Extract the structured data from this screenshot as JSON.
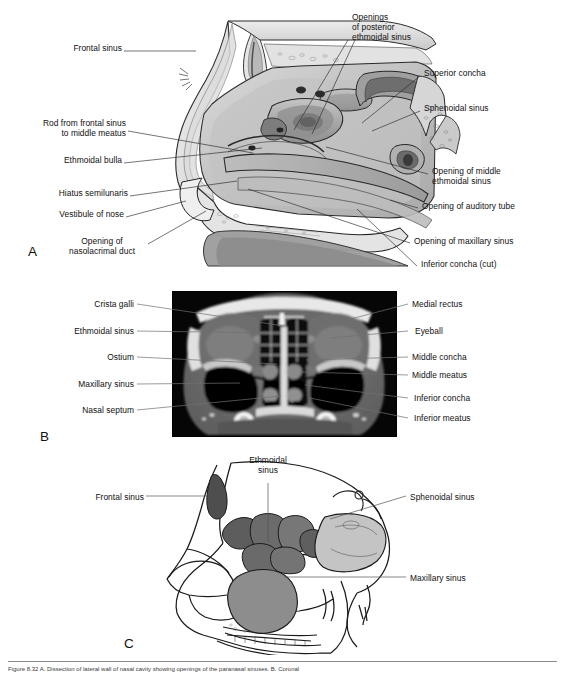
{
  "figure": {
    "width": 565,
    "height": 676,
    "panel_letters": [
      "A",
      "B",
      "C"
    ],
    "caption": "Figure 8.32   A. Dissection of lateral wall of nasal cavity showing openings of the paranasal sinuses. B. Coronal"
  },
  "panel_a": {
    "letter": "A",
    "type": "line-art-dissection",
    "description": "Sagittal dissection of the lateral wall of the nasal cavity",
    "labels_left": [
      {
        "text": "Frontal sinus",
        "x": 118,
        "y": 47,
        "lx": 124,
        "ly": 51,
        "tx": 196,
        "ty": 51
      },
      {
        "text": "Rod from frontal sinus\nto middle meatus",
        "x": 124,
        "y": 122,
        "lx": 128,
        "ly": 131,
        "tx": 253,
        "ty": 153
      },
      {
        "text": "Ethmoidal bulla",
        "x": 117,
        "y": 159,
        "lx": 124,
        "ly": 163,
        "tx": 262,
        "ty": 148
      },
      {
        "text": "Hiatus semilunaris",
        "x": 126,
        "y": 192,
        "lx": 130,
        "ly": 196,
        "tx": 235,
        "ty": 180
      },
      {
        "text": "Vestibule of nose",
        "x": 121,
        "y": 213,
        "lx": 126,
        "ly": 217,
        "tx": 183,
        "ty": 200
      },
      {
        "text": "Opening of\nnasolacrimal duct",
        "x": 120,
        "y": 240,
        "lx": 148,
        "ly": 244,
        "tx": 205,
        "ty": 210
      }
    ],
    "labels_right": [
      {
        "text": "Openings\nof posterior\nethmoidal sinus",
        "x": 352,
        "y": 16,
        "lx": 348,
        "ly": 40,
        "tx": 293,
        "ty": 132
      },
      {
        "text": "Openings\nof posterior\nethmoidal sinus 2",
        "x": -1,
        "y": -1,
        "lx": 350,
        "ly": 42,
        "tx": 310,
        "ty": 135
      },
      {
        "text": "Superior concha",
        "x": 424,
        "y": 72,
        "lx": 420,
        "ly": 76,
        "tx": 360,
        "ty": 125
      },
      {
        "text": "Sphenoidal sinus",
        "x": 424,
        "y": 107,
        "lx": 420,
        "ly": 111,
        "tx": 370,
        "ty": 132
      },
      {
        "text": "Opening of middle\nethmoidal sinus",
        "x": 432,
        "y": 170,
        "lx": 428,
        "ly": 174,
        "tx": 325,
        "ty": 148
      },
      {
        "text": "Opening of auditory tube",
        "x": 422,
        "y": 205,
        "lx": 418,
        "ly": 208,
        "tx": 387,
        "ty": 200
      },
      {
        "text": "Opening of maxillary sinus",
        "x": 414,
        "y": 240,
        "lx": 410,
        "ly": 243,
        "tx": 248,
        "ty": 190
      },
      {
        "text": "Inferior concha (cut)",
        "x": 421,
        "y": 263,
        "lx": 417,
        "ly": 266,
        "tx": 355,
        "ty": 210
      }
    ]
  },
  "panel_b": {
    "letter": "B",
    "type": "ct-scan",
    "description": "Coronal CT scan of the paranasal sinuses",
    "image_rect": {
      "x": 172,
      "y": 291,
      "w": 225,
      "h": 146
    },
    "labels_left": [
      {
        "text": "Crista galli",
        "x": 88,
        "y": 300,
        "lx": 137,
        "ly": 304,
        "tx": 284,
        "ty": 326
      },
      {
        "text": "Ethmoidal sinus",
        "x": 68,
        "y": 327,
        "lx": 137,
        "ly": 331,
        "tx": 272,
        "ty": 333
      },
      {
        "text": "Ostium",
        "x": 107,
        "y": 353,
        "lx": 137,
        "ly": 357,
        "tx": 277,
        "ty": 364
      },
      {
        "text": "Maxillary sinus",
        "x": 73,
        "y": 380,
        "lx": 137,
        "ly": 384,
        "tx": 240,
        "ty": 383
      },
      {
        "text": "Nasal septum",
        "x": 78,
        "y": 406,
        "lx": 137,
        "ly": 410,
        "tx": 281,
        "ty": 395
      }
    ],
    "labels_right": [
      {
        "text": "Medial rectus",
        "x": 412,
        "y": 300,
        "lx": 408,
        "ly": 304,
        "tx": 320,
        "ty": 327
      },
      {
        "text": "Eyeball",
        "x": 415,
        "y": 327,
        "lx": 408,
        "ly": 331,
        "tx": 330,
        "ty": 338
      },
      {
        "text": "Middle concha",
        "x": 412,
        "y": 353,
        "lx": 408,
        "ly": 357,
        "tx": 306,
        "ty": 360
      },
      {
        "text": "Middle meatus",
        "x": 412,
        "y": 371,
        "lx": 408,
        "ly": 375,
        "tx": 302,
        "ty": 372
      },
      {
        "text": "Inferior concha",
        "x": 412,
        "y": 395,
        "lx": 408,
        "ly": 398,
        "tx": 305,
        "ty": 385
      },
      {
        "text": "Inferior meatus",
        "x": 412,
        "y": 415,
        "lx": 408,
        "ly": 418,
        "tx": 310,
        "ty": 398
      }
    ]
  },
  "panel_c": {
    "letter": "C",
    "type": "line-art-skull",
    "description": "Lateral view of skull showing the paranasal sinuses shaded",
    "labels": [
      {
        "text": "Ethmoidal\nsinus",
        "x": 228,
        "y": 458,
        "align": "center",
        "lx": 268,
        "ly": 483,
        "tx": 270,
        "ty": 540
      },
      {
        "text": "Frontal sinus",
        "x": 85,
        "y": 492,
        "align": "right",
        "lx": 146,
        "ly": 496,
        "tx": 210,
        "ty": 496
      },
      {
        "text": "Sphenoidal sinus",
        "x": 410,
        "y": 492,
        "align": "left",
        "lx": 406,
        "ly": 496,
        "tx": 330,
        "ty": 518
      },
      {
        "text": "Maxillary sinus",
        "x": 410,
        "y": 573,
        "align": "left",
        "lx": 406,
        "ly": 577,
        "tx": 285,
        "ty": 577
      }
    ],
    "sinus_colors": {
      "frontal": "#5a5a5a",
      "ethmoidal": "#6e6e6e",
      "sphenoidal": "#b8b8b8",
      "maxillary": "#8c8c8c"
    }
  },
  "colors": {
    "ink": "#1a1a1a",
    "leader": "#2a2a2a",
    "ct_leader": "#707070",
    "paper": "#ffffff"
  }
}
